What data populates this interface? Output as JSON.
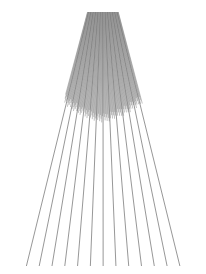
{
  "artwork": {
    "title": "Radial Perspective Line Pattern",
    "description": "Fan of straight rays diverging downward from a dense convergence band at the top edge, lengths varying so most rays terminate along a shallow curved boundary in the upper-middle while a sparse subset continues to the bottom.",
    "canvas": {
      "width": 206,
      "height": 274,
      "background_color": "#ffffff"
    },
    "line_style": {
      "color": "#5a5a5a",
      "color_faint": "#8d8d8d",
      "width": 0.55,
      "cap": "butt"
    },
    "geometry": {
      "vanishing_point_x": 103,
      "vanishing_point_y": -46,
      "apex_band_y": 12,
      "apex_band_left_x": 15,
      "apex_band_right_x": 193,
      "bottom_span_left_x": 20,
      "bottom_span_right_x": 185,
      "bottom_terminus_y": 266,
      "short_terminus_center_y": 118,
      "short_terminus_edge_y": 99,
      "ray_count": 130,
      "long_ray_count": 13,
      "long_ray_interval": 10
    },
    "chart_data": {
      "type": "line",
      "title": "Radial Perspective Line Pattern",
      "xlabel": "",
      "ylabel": "",
      "xlim": [
        0,
        206
      ],
      "ylim": [
        0,
        274
      ],
      "grid": false,
      "legend": "none",
      "series": [
        {
          "name": "short-rays",
          "count": 117,
          "start_y": 12,
          "end_y_center": 118,
          "end_y_edge": 99,
          "color": "#5a5a5a"
        },
        {
          "name": "long-rays",
          "count": 13,
          "start_y": 12,
          "end_y": 266,
          "color": "#5a5a5a"
        }
      ]
    }
  }
}
